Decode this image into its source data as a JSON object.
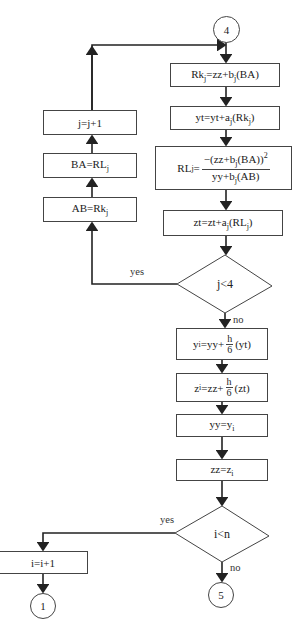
{
  "connectors": {
    "start": "4",
    "end_no": "5",
    "end_yes": "1"
  },
  "inner_loop": {
    "steps": [
      {
        "lhs": "Rk",
        "lhs_sub": "j",
        "rhs": "=zz+b",
        "rhs_sub": "j",
        "rhs_tail": "(BA)"
      },
      {
        "lhs": "yt",
        "rhs": "=yt+a",
        "rhs_sub": "j",
        "rhs_tail": "(Rk",
        "tail_sub": "j",
        "tail_end": ")"
      },
      {
        "lhs": "RL",
        "lhs_sub": "j",
        "eq": "=",
        "num": "−(zz+b",
        "num_sub": "j",
        "num_tail": "(BA))",
        "num_sup": "2",
        "den": "yy+b",
        "den_sub": "j",
        "den_tail": "(AB)"
      },
      {
        "lhs": "zt",
        "rhs": "=zt+a",
        "rhs_sub": "j",
        "rhs_tail": "(RL",
        "tail_sub": "j",
        "tail_end": ")"
      }
    ],
    "decision": {
      "text": "j<4",
      "yes": "yes",
      "no": "no"
    },
    "back_steps": [
      {
        "text": "AB=Rk",
        "sub": "j"
      },
      {
        "text": "BA=RL",
        "sub": "j"
      },
      {
        "text": "j=j+1"
      }
    ]
  },
  "outer_loop": {
    "steps": [
      {
        "lhs": "y",
        "lhs_sub": "i",
        "rhs": "=yy+",
        "frac_num": "h",
        "frac_den": "6",
        "tail": "(yt)"
      },
      {
        "lhs": "z",
        "lhs_sub": "i",
        "rhs": "=zz+",
        "frac_num": "h",
        "frac_den": "6",
        "tail": "(zt)"
      },
      {
        "text": "yy=y",
        "sub": "i"
      },
      {
        "text": "zz=z",
        "sub": "i"
      }
    ],
    "decision": {
      "text": "i<n",
      "yes": "yes",
      "no": "no"
    },
    "increment": {
      "text": "i=i+1"
    }
  }
}
